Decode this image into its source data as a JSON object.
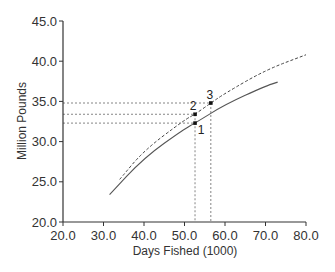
{
  "chart_data": {
    "type": "line",
    "title": "",
    "xlabel": "Days Fished (1000)",
    "ylabel": "Million Pounds",
    "xlim": [
      20,
      80
    ],
    "ylim": [
      20,
      45
    ],
    "xticks": [
      "20.0",
      "30.0",
      "40.0",
      "50.0",
      "60.0",
      "70.0",
      "80.0"
    ],
    "yticks": [
      "20.0",
      "25.0",
      "30.0",
      "35.0",
      "40.0",
      "45.0"
    ],
    "grid": false,
    "legend": null,
    "series": [
      {
        "name": "solid curve",
        "style": "solid",
        "x": [
          31.5,
          40,
          50,
          52.6,
          60,
          70,
          73
        ],
        "y": [
          23.4,
          28.0,
          31.6,
          32.3,
          34.6,
          36.9,
          37.4
        ]
      },
      {
        "name": "dashed curve",
        "style": "dashed",
        "x": [
          34,
          40,
          50,
          52.6,
          56.5,
          60,
          70,
          80
        ],
        "y": [
          25.3,
          28.9,
          32.7,
          33.4,
          34.8,
          36.0,
          38.9,
          40.8
        ]
      }
    ],
    "annotations": [
      {
        "label": "1",
        "x": 52.6,
        "y": 32.3
      },
      {
        "label": "2",
        "x": 52.6,
        "y": 33.4
      },
      {
        "label": "3",
        "x": 56.5,
        "y": 34.8
      }
    ],
    "reference_lines": {
      "horizontal": [
        32.3,
        33.4,
        34.8
      ],
      "vertical": [
        52.6,
        56.5
      ]
    }
  }
}
